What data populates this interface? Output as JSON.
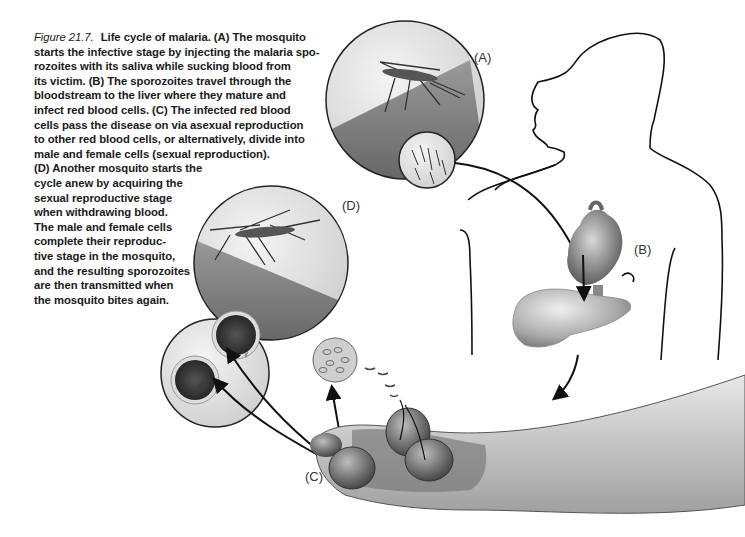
{
  "figure": {
    "number_label": "Figure 21.7.",
    "caption_lines": [
      "Life cycle of malaria. (A) The mosquito",
      "starts the infective stage by injecting the malaria spo-",
      "rozoites with its saliva while sucking blood from",
      "its victim. (B) The sporozoites travel through the",
      "bloodstream to the liver where they mature and",
      "infect red blood cells. (C) The infected red blood",
      "cells pass the disease on via asexual reproduction",
      "to other red blood cells, or alternatively, divide into",
      "male and female cells (sexual reproduction).",
      "(D) Another mosquito starts the",
      "cycle anew by acquiring the",
      "sexual reproductive stage",
      "when withdrawing blood.",
      "The male and female cells",
      "complete their reproduc-",
      "tive stage in the mosquito,",
      "and the resulting sporozoites",
      "are then transmitted when",
      "the mosquito bites again."
    ]
  },
  "labels": {
    "a": "(A)",
    "b": "(B)",
    "c": "(C)",
    "d": "(D)",
    "male_symbol": "♂",
    "female_symbol": "♀"
  },
  "stages": [
    {
      "id": "A",
      "description": "Mosquito bite injects sporozoites"
    },
    {
      "id": "B",
      "description": "Sporozoites travel to heart and liver"
    },
    {
      "id": "C",
      "description": "Infected red blood cells in blood vessel"
    },
    {
      "id": "D",
      "description": "Mosquito acquires sexual stage"
    }
  ]
}
